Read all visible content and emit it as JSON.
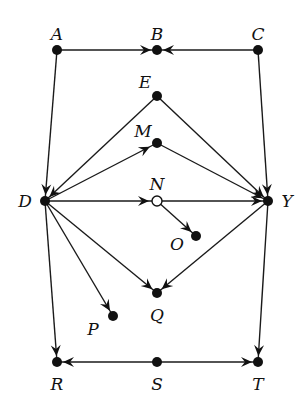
{
  "diagram": {
    "type": "directed-graph",
    "nodes": [
      {
        "id": "A",
        "label": "A",
        "x": 57,
        "y": 50,
        "style": "filled",
        "lx": 57,
        "ly": 40,
        "anchor": "middle"
      },
      {
        "id": "B",
        "label": "B",
        "x": 157,
        "y": 50,
        "style": "filled",
        "lx": 157,
        "ly": 40,
        "anchor": "middle"
      },
      {
        "id": "C",
        "label": "C",
        "x": 258,
        "y": 50,
        "style": "filled",
        "lx": 258,
        "ly": 40,
        "anchor": "middle"
      },
      {
        "id": "E",
        "label": "E",
        "x": 157,
        "y": 96,
        "style": "filled",
        "lx": 145,
        "ly": 88,
        "anchor": "middle"
      },
      {
        "id": "M",
        "label": "M",
        "x": 157,
        "y": 143,
        "style": "filled",
        "lx": 143,
        "ly": 137,
        "anchor": "middle"
      },
      {
        "id": "D",
        "label": "D",
        "x": 45,
        "y": 201,
        "style": "filled",
        "lx": 25,
        "ly": 207,
        "anchor": "middle"
      },
      {
        "id": "N",
        "label": "N",
        "x": 157,
        "y": 201,
        "style": "hollow",
        "lx": 157,
        "ly": 190,
        "anchor": "middle"
      },
      {
        "id": "Y",
        "label": "Y",
        "x": 268,
        "y": 201,
        "style": "filled",
        "lx": 287,
        "ly": 207,
        "anchor": "middle"
      },
      {
        "id": "O",
        "label": "O",
        "x": 196,
        "y": 236,
        "style": "filled",
        "lx": 177,
        "ly": 250,
        "anchor": "middle"
      },
      {
        "id": "Q",
        "label": "Q",
        "x": 157,
        "y": 293,
        "style": "filled",
        "lx": 157,
        "ly": 321,
        "anchor": "middle"
      },
      {
        "id": "P",
        "label": "P",
        "x": 113,
        "y": 316,
        "style": "filled",
        "lx": 93,
        "ly": 335,
        "anchor": "middle"
      },
      {
        "id": "R",
        "label": "R",
        "x": 57,
        "y": 362,
        "style": "filled",
        "lx": 57,
        "ly": 390,
        "anchor": "middle"
      },
      {
        "id": "S",
        "label": "S",
        "x": 157,
        "y": 362,
        "style": "filled",
        "lx": 157,
        "ly": 390,
        "anchor": "middle"
      },
      {
        "id": "T",
        "label": "T",
        "x": 258,
        "y": 362,
        "style": "filled",
        "lx": 258,
        "ly": 390,
        "anchor": "middle"
      }
    ],
    "edges": [
      {
        "from": "A",
        "to": "B",
        "arrow_at": "end"
      },
      {
        "from": "C",
        "to": "B",
        "arrow_at": "end"
      },
      {
        "from": "A",
        "to": "D",
        "arrow_at": "end"
      },
      {
        "from": "C",
        "to": "Y",
        "arrow_at": "end"
      },
      {
        "from": "E",
        "to": "D",
        "arrow_at": "end"
      },
      {
        "from": "E",
        "to": "Y",
        "arrow_at": "end"
      },
      {
        "from": "D",
        "to": "M",
        "arrow_at": "mid"
      },
      {
        "from": "M",
        "to": "Y",
        "arrow_at": "end"
      },
      {
        "from": "D",
        "to": "N",
        "arrow_at": "mid"
      },
      {
        "from": "N",
        "to": "Y",
        "arrow_at": "end"
      },
      {
        "from": "N",
        "to": "O",
        "arrow_at": "end"
      },
      {
        "from": "D",
        "to": "Q",
        "arrow_at": "end"
      },
      {
        "from": "Y",
        "to": "Q",
        "arrow_at": "end"
      },
      {
        "from": "D",
        "to": "P",
        "arrow_at": "end"
      },
      {
        "from": "D",
        "to": "R",
        "arrow_at": "end"
      },
      {
        "from": "Y",
        "to": "T",
        "arrow_at": "end"
      },
      {
        "from": "S",
        "to": "R",
        "arrow_at": "end"
      },
      {
        "from": "S",
        "to": "T",
        "arrow_at": "end"
      }
    ],
    "colors": {
      "ink": "#111111",
      "background": "#ffffff"
    }
  }
}
